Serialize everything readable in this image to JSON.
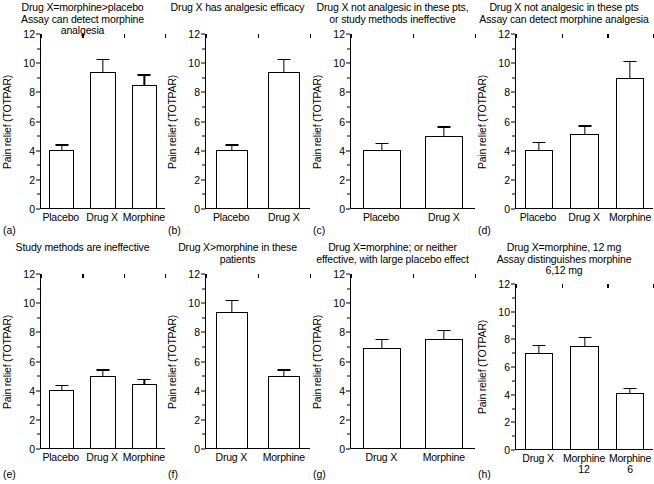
{
  "figure": {
    "ylabel": "Pain relief (TOTPAR)",
    "y_ticks": [
      "0",
      "2",
      "4",
      "6",
      "8",
      "10",
      "12"
    ],
    "ylim": [
      0,
      12
    ]
  },
  "chart_data": [
    {
      "type": "bar",
      "panel": "(a)",
      "title": "Drug X=morphine>placebo\nAssay can detect morphine analgesia",
      "categories": [
        "Placebo",
        "Drug X",
        "Morphine"
      ],
      "values": [
        4.0,
        9.4,
        8.5
      ],
      "errors_upper": [
        5.1,
        10.5,
        9.5
      ],
      "ylabel": "Pain relief (TOTPAR)",
      "xlabel": "",
      "ylim": [
        0,
        12
      ],
      "grid": false
    },
    {
      "type": "bar",
      "panel": "(b)",
      "title": "Drug X has analgesic efficacy",
      "categories": [
        "Placebo",
        "Drug X"
      ],
      "values": [
        4.0,
        9.4
      ],
      "errors_upper": [
        5.1,
        10.5
      ],
      "ylabel": "Pain relief (TOTPAR)",
      "xlabel": "",
      "ylim": [
        0,
        12
      ],
      "grid": false
    },
    {
      "type": "bar",
      "panel": "(c)",
      "title": "Drug X not analgesic in these pts,\nor study methods ineffective",
      "categories": [
        "Placebo",
        "Drug X"
      ],
      "values": [
        4.0,
        5.0
      ],
      "errors_upper": [
        5.5,
        6.5
      ],
      "ylabel": "Pain relief (TOTPAR)",
      "xlabel": "",
      "ylim": [
        0,
        12
      ],
      "grid": false
    },
    {
      "type": "bar",
      "panel": "(d)",
      "title": "Drug X not analgesic in these pts\nAssay can detect morphine analgesia",
      "categories": [
        "Placebo",
        "Drug X",
        "Morphine"
      ],
      "values": [
        4.0,
        5.1,
        9.0
      ],
      "errors_upper": [
        5.6,
        6.5,
        10.5
      ],
      "ylabel": "Pain relief (TOTPAR)",
      "xlabel": "",
      "ylim": [
        0,
        12
      ],
      "grid": false
    },
    {
      "type": "bar",
      "panel": "(e)",
      "title": "Study methods are ineffective",
      "categories": [
        "Placebo",
        "Drug X",
        "Morphine"
      ],
      "values": [
        4.0,
        5.0,
        4.4
      ],
      "errors_upper": [
        5.0,
        6.0,
        5.4
      ],
      "ylabel": "Pain relief (TOTPAR)",
      "xlabel": "",
      "ylim": [
        0,
        12
      ],
      "grid": false
    },
    {
      "type": "bar",
      "panel": "(f)",
      "title": "Drug X>morphine in these patients",
      "categories": [
        "Drug X",
        "Morphine"
      ],
      "values": [
        9.4,
        5.0
      ],
      "errors_upper": [
        10.4,
        6.0
      ],
      "ylabel": "Pain relief (TOTPAR)",
      "xlabel": "",
      "ylim": [
        0,
        12
      ],
      "grid": false
    },
    {
      "type": "bar",
      "panel": "(g)",
      "title": "Drug X=morphine; or neither\neffective, with large placebo effect",
      "categories": [
        "Drug X",
        "Morphine"
      ],
      "values": [
        6.9,
        7.5
      ],
      "errors_upper": [
        8.0,
        8.5
      ],
      "ylabel": "Pain relief (TOTPAR)",
      "xlabel": "",
      "ylim": [
        0,
        12
      ],
      "grid": false
    },
    {
      "type": "bar",
      "panel": "(h)",
      "title": "Drug X=morphine, 12 mg\nAssay distinguishes morphine\n6,12 mg",
      "categories": [
        "Drug X",
        "Morphine\n12",
        "Morphine\n6"
      ],
      "values": [
        7.0,
        7.5,
        4.1
      ],
      "errors_upper": [
        8.0,
        8.5,
        5.0
      ],
      "ylabel": "Pain relief (TOTPAR)",
      "xlabel": "",
      "ylim": [
        0,
        12
      ],
      "grid": false
    }
  ]
}
